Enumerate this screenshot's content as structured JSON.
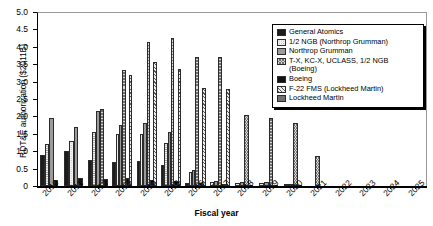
{
  "chart_data": {
    "type": "bar",
    "title": "",
    "xlabel": "Fiscal year",
    "ylabel": "RDT&E authorization ($2011B)",
    "ylim": [
      0,
      5.0
    ],
    "yticks": [
      "0",
      "0.5",
      "1.0",
      "1.5",
      "2.0",
      "2.5",
      "3.0",
      "3.5",
      "4.0",
      "4.5",
      "5.0"
    ],
    "grid": false,
    "legend_position": "top-right",
    "categories": [
      "2010",
      "2011",
      "2012",
      "2013",
      "2014",
      "2015",
      "2016",
      "2017",
      "2018",
      "2019",
      "2020",
      "2021",
      "2022",
      "2023",
      "2024",
      "2025"
    ],
    "series": [
      {
        "name": "General Atomics",
        "style": "s0",
        "values": [
          0.9,
          1.0,
          0.75,
          0.68,
          0.72,
          0.6,
          0.1,
          0.0,
          0.0,
          0.0,
          0.0,
          0,
          0,
          0,
          0,
          0
        ]
      },
      {
        "name": "1/2 NGB (Northrop Grumman)",
        "style": "s1",
        "values": [
          1.2,
          1.3,
          1.55,
          1.5,
          1.5,
          1.25,
          0.4,
          0.12,
          0.1,
          0.1,
          0.05,
          0,
          0,
          0,
          0,
          0
        ]
      },
      {
        "name": "Northrop Grumman",
        "style": "s2",
        "values": [
          1.95,
          1.7,
          2.15,
          1.75,
          1.8,
          1.55,
          0.45,
          0.13,
          0.11,
          0.11,
          0.06,
          0,
          0,
          0,
          0,
          0
        ]
      },
      {
        "name": "T-X, KC-X, UCLASS, 1/2 NGB (Boeing)",
        "style": "s3",
        "values": [
          0.0,
          0.0,
          2.2,
          3.32,
          4.15,
          4.25,
          3.72,
          3.72,
          2.05,
          1.95,
          1.82,
          0.85,
          0,
          0,
          0,
          0
        ]
      },
      {
        "name": "Boeing",
        "style": "s4",
        "values": [
          0.18,
          0.22,
          0.2,
          0.22,
          0.18,
          0.15,
          0.08,
          0.05,
          0.04,
          0.03,
          0.02,
          0,
          0,
          0,
          0,
          0
        ]
      },
      {
        "name": "F-22 FMS (Lockheed Martin)",
        "style": "s5",
        "values": [
          0.0,
          0.0,
          0.0,
          3.18,
          3.57,
          3.35,
          2.82,
          2.8,
          0.0,
          0.0,
          0.0,
          0,
          0,
          0,
          0,
          0
        ]
      },
      {
        "name": "Lockheed Martin",
        "style": "s6",
        "values": [
          0.0,
          0.0,
          0.0,
          0.0,
          0.0,
          0.0,
          0.0,
          0.0,
          0.0,
          0.0,
          0.0,
          0,
          0,
          0,
          0,
          0
        ]
      }
    ]
  },
  "axis": {
    "y_title": "RDT&E authorization ($2011B)",
    "x_title": "Fiscal year"
  },
  "legend": {
    "items": [
      {
        "label": "General Atomics",
        "style": "s0"
      },
      {
        "label": "1/2 NGB (Northrop Grumman)",
        "style": "s1"
      },
      {
        "label": "Northrop Grumman",
        "style": "s2"
      },
      {
        "label": "T-X, KC-X, UCLASS, 1/2 NGB\n(Boeing)",
        "style": "s3"
      },
      {
        "label": "Boeing",
        "style": "s4"
      },
      {
        "label": "F-22 FMS (Lockheed Martin)",
        "style": "s5"
      },
      {
        "label": "Lockheed Martin",
        "style": "s6"
      }
    ]
  }
}
